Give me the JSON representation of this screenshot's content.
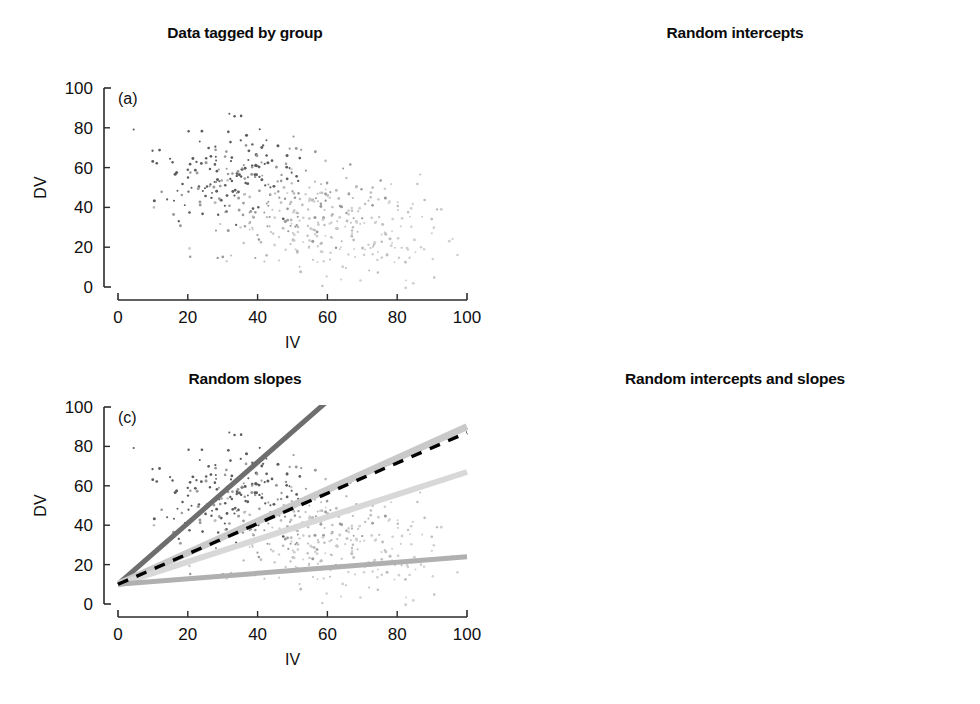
{
  "figure": {
    "axis_labels": {
      "x": "IV",
      "y": "DV"
    },
    "tick_values": [
      0,
      20,
      40,
      60,
      80,
      100
    ],
    "xlim": [
      0,
      100
    ],
    "ylim": [
      0,
      100
    ],
    "group_colors": [
      "#6e6e6e",
      "#c9c9c9",
      "#d6d6d6",
      "#b0b0b0"
    ],
    "mean_line_color": "#000000"
  },
  "panels": [
    {
      "tag": "(a)",
      "title": "Data tagged by group",
      "xlabel": "IV",
      "ylabel": "DV",
      "lines": []
    },
    {
      "tag": "(b)",
      "title": "Random intercepts",
      "xlabel": "IV",
      "ylabel": "DV",
      "lines": [
        {
          "group": "group-1",
          "intercept": 34,
          "slope": 0.85,
          "color": "#6e6e6e",
          "width": 5
        },
        {
          "group": "group-2",
          "intercept": 7,
          "slope": 0.85,
          "color": "#c9c9c9",
          "width": 7
        },
        {
          "group": "group-3",
          "intercept": -7,
          "slope": 0.85,
          "color": "#d8d8d8",
          "width": 6
        },
        {
          "group": "group-4",
          "intercept": -32,
          "slope": 0.85,
          "color": "#b0b0b0",
          "width": 5
        },
        {
          "group": "fixed-effect-mean",
          "intercept": 0,
          "slope": 0.86,
          "color": "#000000",
          "width": 3.4,
          "dashed": true
        }
      ]
    },
    {
      "tag": "(c)",
      "title": "Random slopes",
      "xlabel": "IV",
      "ylabel": "DV",
      "lines": [
        {
          "group": "group-1",
          "intercept": 10,
          "slope": 1.55,
          "color": "#6e6e6e",
          "width": 5
        },
        {
          "group": "group-2",
          "intercept": 10,
          "slope": 0.8,
          "color": "#c9c9c9",
          "width": 7
        },
        {
          "group": "group-3",
          "intercept": 10,
          "slope": 0.57,
          "color": "#d8d8d8",
          "width": 6
        },
        {
          "group": "group-4",
          "intercept": 10,
          "slope": 0.14,
          "color": "#b0b0b0",
          "width": 5
        },
        {
          "group": "fixed-effect-mean",
          "intercept": 10,
          "slope": 0.77,
          "color": "#000000",
          "width": 3.4,
          "dashed": true
        }
      ]
    },
    {
      "tag": "(d)",
      "title": "Random intercepts and slopes",
      "xlabel": "IV",
      "ylabel": "DV",
      "lines": [
        {
          "group": "group-1",
          "intercept": 33,
          "slope": 0.88,
          "color": "#6e6e6e",
          "width": 5
        },
        {
          "group": "group-2",
          "intercept": 6,
          "slope": 0.95,
          "color": "#c9c9c9",
          "width": 7
        },
        {
          "group": "group-3",
          "intercept": 1,
          "slope": 0.87,
          "color": "#d8d8d8",
          "width": 6
        },
        {
          "group": "group-4",
          "intercept": -15,
          "slope": 0.85,
          "color": "#dcdcdc",
          "width": 6
        },
        {
          "group": "group-5",
          "intercept": -6,
          "slope": 0.43,
          "color": "#b0b0b0",
          "width": 5
        },
        {
          "group": "fixed-effect-mean",
          "intercept": 0,
          "slope": 0.88,
          "color": "#000000",
          "width": 3.4,
          "dashed": true
        }
      ]
    }
  ],
  "chart_data": {
    "type": "scatter",
    "xlabel": "IV",
    "ylabel": "DV",
    "xlim": [
      0,
      100
    ],
    "ylim": [
      0,
      100
    ],
    "xticks": [
      0,
      20,
      40,
      60,
      80,
      100
    ],
    "yticks": [
      0,
      20,
      40,
      60,
      80,
      100
    ],
    "grid": false,
    "legend": "none",
    "n_groups": 4,
    "n_points_approx": 480,
    "subplots": [
      {
        "tag": "(a)",
        "title": "Data tagged by group",
        "description": "Scatter of all observations shaded by group; darker points cluster upper-left, lighter points lower-right."
      },
      {
        "tag": "(b)",
        "title": "Random intercepts",
        "description": "Four parallel group regression lines (common slope ~0.85) with differing intercepts, plus dashed fixed-effect mean line.",
        "series": [
          {
            "name": "group-1",
            "intercept": 34,
            "slope": 0.85,
            "y_at_x0": 34,
            "y_at_x100": 119
          },
          {
            "name": "group-2",
            "intercept": 7,
            "slope": 0.85,
            "y_at_x0": 7,
            "y_at_x100": 92
          },
          {
            "name": "group-3",
            "intercept": -7,
            "slope": 0.85,
            "y_at_x0": -7,
            "y_at_x100": 78
          },
          {
            "name": "group-4",
            "intercept": -32,
            "slope": 0.85,
            "y_at_x0": -32,
            "y_at_x100": 53
          },
          {
            "name": "fixed-effect-mean",
            "intercept": 0,
            "slope": 0.86,
            "y_at_x0": 0,
            "y_at_x100": 86,
            "style": "dashed"
          }
        ]
      },
      {
        "tag": "(c)",
        "title": "Random slopes",
        "description": "Four group lines share a common intercept of 10 at IV=0 and fan out with differing slopes, plus dashed fixed-effect mean line.",
        "series": [
          {
            "name": "group-1",
            "intercept": 10,
            "slope": 1.55,
            "y_at_x0": 10,
            "y_at_x100": 165
          },
          {
            "name": "group-2",
            "intercept": 10,
            "slope": 0.8,
            "y_at_x0": 10,
            "y_at_x100": 90
          },
          {
            "name": "group-3",
            "intercept": 10,
            "slope": 0.57,
            "y_at_x0": 10,
            "y_at_x100": 67
          },
          {
            "name": "group-4",
            "intercept": 10,
            "slope": 0.14,
            "y_at_x0": 10,
            "y_at_x100": 24
          },
          {
            "name": "fixed-effect-mean",
            "intercept": 10,
            "slope": 0.77,
            "y_at_x0": 10,
            "y_at_x100": 87,
            "style": "dashed"
          }
        ]
      },
      {
        "tag": "(d)",
        "title": "Random intercepts and slopes",
        "description": "Group lines differ in both intercept and slope, plus dashed fixed-effect mean line.",
        "series": [
          {
            "name": "group-1",
            "intercept": 33,
            "slope": 0.88,
            "y_at_x0": 33,
            "y_at_x100": 121
          },
          {
            "name": "group-2",
            "intercept": 6,
            "slope": 0.95,
            "y_at_x0": 6,
            "y_at_x100": 101
          },
          {
            "name": "group-3",
            "intercept": 1,
            "slope": 0.87,
            "y_at_x0": 1,
            "y_at_x100": 88
          },
          {
            "name": "group-4",
            "intercept": -15,
            "slope": 0.85,
            "y_at_x0": -15,
            "y_at_x100": 70
          },
          {
            "name": "group-5",
            "intercept": -6,
            "slope": 0.43,
            "y_at_x0": -6,
            "y_at_x100": 37
          },
          {
            "name": "fixed-effect-mean",
            "intercept": 0,
            "slope": 0.88,
            "y_at_x0": 0,
            "y_at_x100": 88,
            "style": "dashed"
          }
        ]
      }
    ]
  }
}
